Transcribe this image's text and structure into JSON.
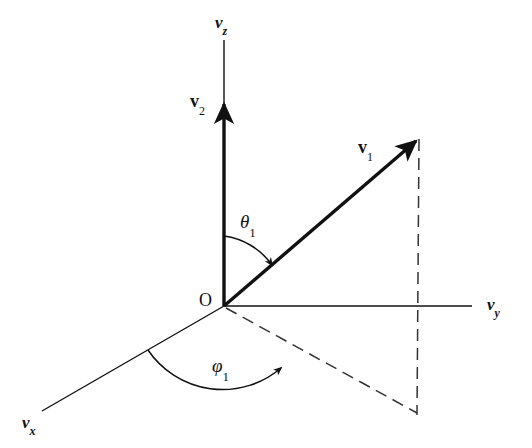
{
  "figure": {
    "background_color": "#ffffff",
    "stroke_color": "#111111",
    "width": 532,
    "height": 448
  },
  "axes": [
    {
      "id": "vz",
      "symbol": "v",
      "subscript": "z",
      "label": "v_z",
      "description": "vertical velocity axis pointing up"
    },
    {
      "id": "vy",
      "symbol": "v",
      "subscript": "y",
      "label": "v_y",
      "description": "horizontal velocity axis pointing right"
    },
    {
      "id": "vx",
      "symbol": "v",
      "subscript": "x",
      "label": "v_x",
      "description": "velocity axis pointing toward lower left"
    }
  ],
  "origin": {
    "label": "O"
  },
  "vectors": [
    {
      "id": "v1",
      "symbol": "v",
      "subscript": "1",
      "label": "v₁",
      "description": "bold vector toward upper right"
    },
    {
      "id": "v2",
      "symbol": "v",
      "subscript": "2",
      "label": "v₂",
      "description": "bold vector along the vz axis"
    }
  ],
  "angles": [
    {
      "id": "theta1",
      "symbol": "θ",
      "subscript": "1",
      "label": "θ₁",
      "description": "polar angle between vz axis and vector v1"
    },
    {
      "id": "phi1",
      "symbol": "φ",
      "subscript": "1",
      "label": "φ₁",
      "description": "azimuthal angle between vx axis and projection of v1"
    }
  ],
  "construction_lines": [
    {
      "id": "projection-line",
      "style": "dashed",
      "description": "projection of v1 onto the vx-vy plane"
    },
    {
      "id": "drop-line",
      "style": "dashed",
      "description": "vertical dashed line from v1 tip down to the plane"
    }
  ]
}
